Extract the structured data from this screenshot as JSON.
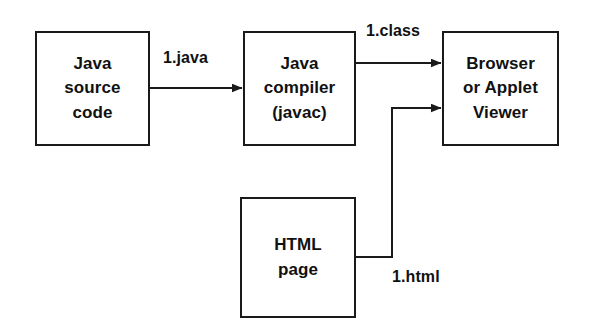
{
  "diagram": {
    "background_color": "#ffffff",
    "stroke_color": "#1a1a1a",
    "text_color": "#111111",
    "nodes": [
      {
        "id": "java-source",
        "label": "Java\nsource\ncode",
        "x": 35,
        "y": 31,
        "width": 115,
        "height": 115
      },
      {
        "id": "java-compiler",
        "label": "Java\ncompiler\n(javac)",
        "x": 243,
        "y": 31,
        "width": 113,
        "height": 115
      },
      {
        "id": "browser",
        "label": "Browser\nor Applet\nViewer",
        "x": 442,
        "y": 31,
        "width": 117,
        "height": 115
      },
      {
        "id": "html-page",
        "label": "HTML\npage",
        "x": 240,
        "y": 197,
        "width": 116,
        "height": 121
      }
    ],
    "edges": [
      {
        "id": "edge-java",
        "label": "1.java",
        "from": "java-source",
        "to": "java-compiler",
        "label_x": 163,
        "label_y": 49
      },
      {
        "id": "edge-class",
        "label": "1.class",
        "from": "java-compiler",
        "to": "browser",
        "label_x": 366,
        "label_y": 22
      },
      {
        "id": "edge-html",
        "label": "1.html",
        "from": "html-page",
        "to": "browser",
        "label_x": 392,
        "label_y": 268
      }
    ]
  }
}
